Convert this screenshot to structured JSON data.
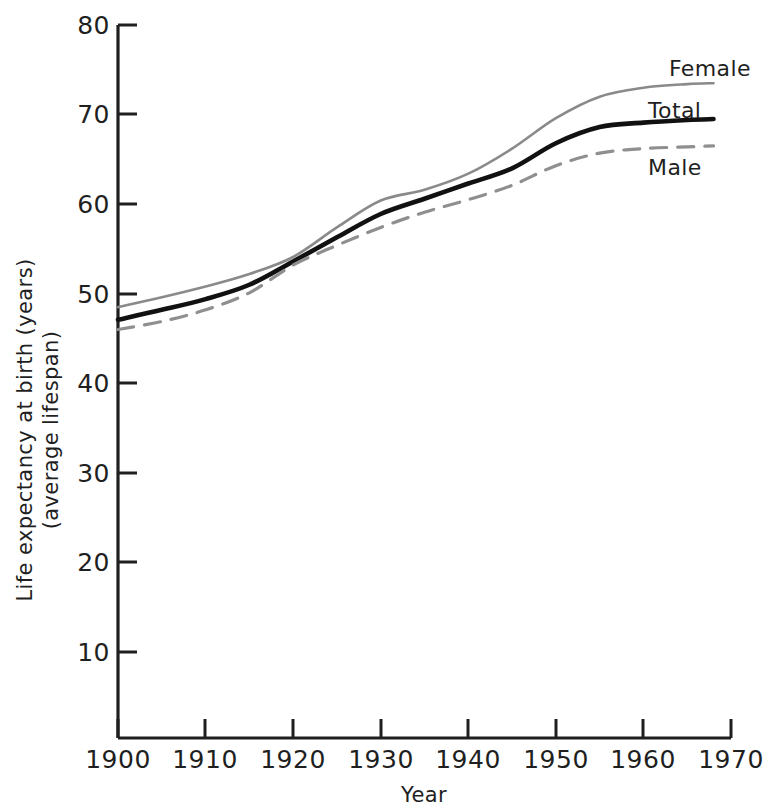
{
  "chart_data": {
    "type": "line",
    "title": "",
    "xlabel": "Year",
    "ylabel": "Life expectancy at birth (years) (average lifespan)",
    "ylabel_line1": "Life expectancy at birth (years)",
    "ylabel_line2": "(average lifespan)",
    "xlim": [
      1900,
      1970
    ],
    "ylim": [
      0,
      80
    ],
    "grid": false,
    "legend_position": "right-inline",
    "xticks": [
      1900,
      1910,
      1920,
      1930,
      1940,
      1950,
      1960,
      1970
    ],
    "xtick_labels": [
      "1900",
      "1910",
      "1920",
      "1930",
      "1940",
      "1950",
      "1960",
      "1970"
    ],
    "yticks": [
      10,
      20,
      30,
      40,
      50,
      60,
      70,
      80
    ],
    "ytick_labels": [
      "10",
      "20",
      "30",
      "40",
      "50",
      "60",
      "70",
      "80"
    ],
    "x": [
      1900,
      1905,
      1910,
      1915,
      1920,
      1925,
      1930,
      1935,
      1940,
      1945,
      1950,
      1955,
      1960,
      1965,
      1968
    ],
    "series": [
      {
        "name": "Female",
        "label": "Female",
        "color": "#8a8a8a",
        "style": "solid",
        "width": 2.6,
        "values": [
          48.5,
          49.6,
          50.8,
          52.2,
          54.1,
          57.4,
          60.4,
          61.6,
          63.4,
          66.2,
          69.6,
          72.0,
          73.0,
          73.4,
          73.5
        ]
      },
      {
        "name": "Total",
        "label": "Total",
        "color": "#111111",
        "style": "solid",
        "width": 4.6,
        "values": [
          47.1,
          48.2,
          49.4,
          51.0,
          53.6,
          56.3,
          58.9,
          60.6,
          62.3,
          64.0,
          66.8,
          68.6,
          69.1,
          69.4,
          69.5
        ]
      },
      {
        "name": "Male",
        "label": "Male",
        "color": "#8f8f8f",
        "style": "dashed",
        "width": 3.2,
        "values": [
          46.0,
          46.9,
          48.2,
          50.1,
          53.2,
          55.4,
          57.4,
          59.1,
          60.5,
          62.1,
          64.3,
          65.7,
          66.2,
          66.4,
          66.5
        ]
      }
    ],
    "annotations": [
      {
        "text": "Female",
        "x": 1962,
        "y": 77.0
      },
      {
        "text": "Total",
        "x": 1959,
        "y": 72.3
      },
      {
        "text": "Male",
        "x": 1959,
        "y": 63.0
      }
    ]
  },
  "axes": {
    "x_axis_name": "year-axis",
    "y_axis_name": "life-expectancy-axis"
  }
}
